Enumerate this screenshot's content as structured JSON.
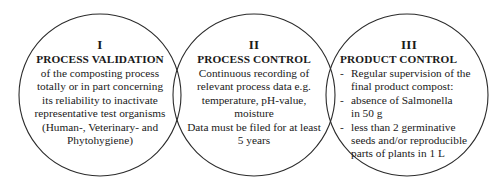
{
  "diagram": {
    "type": "venn-three-overlapping-circles",
    "stroke_color": "#2b2b2b",
    "background_color": "#ffffff",
    "text_color": "#1a1a1a"
  },
  "circles": [
    {
      "numeral": "I",
      "heading": "PROCESS VALIDATION",
      "lines": [
        "of the composting process",
        "totally or in part concerning",
        "its reliability to inactivate",
        "representative test organisms",
        "(Human-, Veterinary- and",
        "Phytohygiene)"
      ]
    },
    {
      "numeral": "II",
      "heading": "PROCESS CONTROL",
      "lines": [
        "Continuous recording of",
        "relevant process data e.g.",
        "temperature, pH-value,",
        "moisture",
        "Data must be filed for at least",
        "5 years"
      ]
    },
    {
      "numeral": "III",
      "heading": "PRODUCT CONTROL",
      "bullet_mark": "-",
      "bullets": [
        {
          "first": "Regular supervision of the",
          "rest": [
            "final product compost:"
          ]
        },
        {
          "first": "absence of Salmonella",
          "rest": [
            "in 50 g"
          ]
        },
        {
          "first": "less than 2 germinative",
          "rest": [
            "seeds and/or reproducible",
            "parts of plants in 1 L"
          ]
        }
      ]
    }
  ]
}
